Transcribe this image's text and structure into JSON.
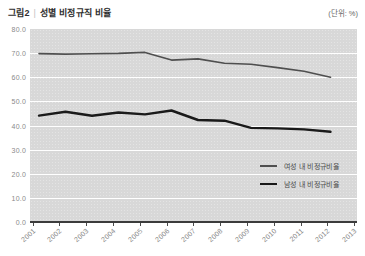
{
  "title": {
    "label": "그림2",
    "separator": "|",
    "text": "성별 비정규직 비율"
  },
  "unit_note": "(단위: %)",
  "chart_data": {
    "type": "line",
    "title": "성별 비정규직 비율",
    "unit": "%",
    "x": [
      2001,
      2002,
      2003,
      2004,
      2005,
      2006,
      2007,
      2008,
      2009,
      2010,
      2011,
      2012
    ],
    "x_axis_labels": [
      "2001",
      "2002",
      "2003",
      "2004",
      "2005",
      "2006",
      "2007",
      "2008",
      "2009",
      "2010",
      "2011",
      "2012",
      "2013"
    ],
    "series": [
      {
        "name": "여성 내 비정규비율",
        "color": "#4f4f4f",
        "stroke_width": 1.6,
        "values": [
          69.8,
          69.6,
          69.7,
          69.9,
          70.3,
          67.1,
          67.6,
          65.8,
          65.4,
          64.0,
          62.5,
          60.0
        ]
      },
      {
        "name": "남성 내 비정규비율",
        "color": "#1a1a1a",
        "stroke_width": 2.4,
        "values": [
          44.1,
          45.7,
          44.0,
          45.4,
          44.6,
          46.2,
          42.3,
          42.0,
          39.0,
          38.8,
          38.4,
          37.4
        ]
      }
    ],
    "ylim": [
      0,
      80
    ],
    "ytick_step": 10,
    "y_tick_labels": [
      "80.0",
      "70.0",
      "60.0",
      "50.0",
      "40.0",
      "30.0",
      "20.0",
      "10.0",
      "0.0"
    ],
    "grid": true,
    "plot_background": "#d8d8d8",
    "gridline_color": "#ffffff",
    "legend_position": "inside-right-middle"
  }
}
